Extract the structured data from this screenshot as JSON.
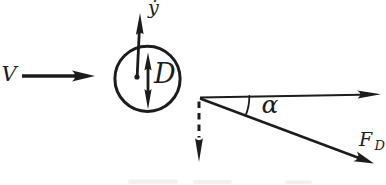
{
  "diagram": {
    "labels": {
      "flow_velocity": "V",
      "transverse_velocity": "ẏ",
      "cylinder_diameter": "D",
      "angle": "α",
      "drag_force": "F",
      "drag_force_sub": "D"
    },
    "colors": {
      "ink": "#1c1c1c",
      "background": "#ffffff"
    }
  }
}
